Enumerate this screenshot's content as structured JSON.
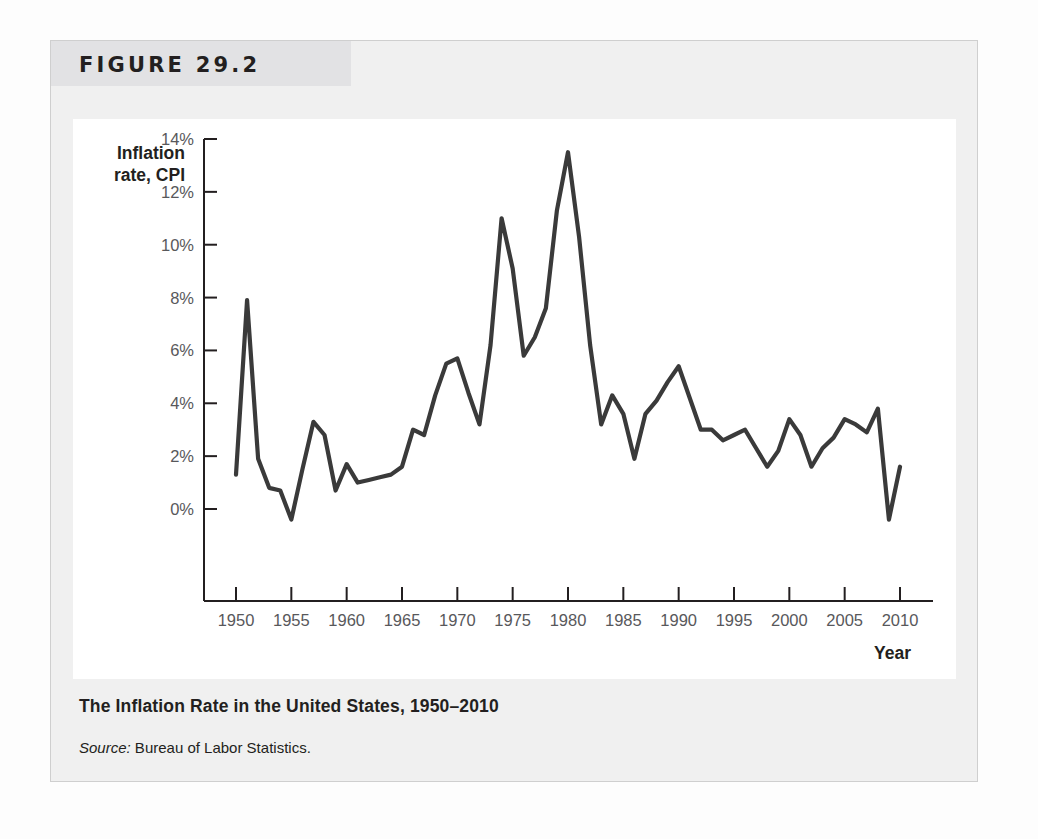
{
  "figure": {
    "number_label": "FIGURE 29.2",
    "caption_title": "The Inflation Rate in the United States, 1950–2010",
    "source_label": "Source:",
    "source_text": " Bureau of Labor Statistics."
  },
  "colors": {
    "line": "#3a3a3a",
    "axis": "#231f20",
    "banner": "#e2e2e4",
    "figure_bg": "#f0f0f0",
    "panel_bg": "#ffffff",
    "tick_label": "#58585b"
  },
  "chart_data": {
    "type": "line",
    "title": "The Inflation Rate in the United States, 1950–2010",
    "xlabel": "Year",
    "ylabel": "Inflation rate, CPI",
    "ylabel_lines": [
      "Inflation",
      "rate, CPI"
    ],
    "xlim": [
      1949,
      2011.5
    ],
    "ylim": [
      -1.2,
      14.6
    ],
    "grid": false,
    "legend": null,
    "ytick_values": [
      0,
      2,
      4,
      6,
      8,
      10,
      12,
      14
    ],
    "ytick_labels": [
      "0%",
      "2%",
      "4%",
      "6%",
      "8%",
      "10%",
      "12%",
      "14%"
    ],
    "xtick_values": [
      1950,
      1955,
      1960,
      1965,
      1970,
      1975,
      1980,
      1985,
      1990,
      1995,
      2000,
      2005,
      2010
    ],
    "xtick_labels": [
      "1950",
      "1955",
      "1960",
      "1965",
      "1970",
      "1975",
      "1980",
      "1985",
      "1990",
      "1995",
      "2000",
      "2005",
      "2010"
    ],
    "series": [
      {
        "name": "Inflation rate, CPI",
        "x": [
          1950,
          1951,
          1952,
          1953,
          1954,
          1955,
          1956,
          1957,
          1958,
          1959,
          1960,
          1961,
          1962,
          1963,
          1964,
          1965,
          1966,
          1967,
          1968,
          1969,
          1970,
          1971,
          1972,
          1973,
          1974,
          1975,
          1976,
          1977,
          1978,
          1979,
          1980,
          1981,
          1982,
          1983,
          1984,
          1985,
          1986,
          1987,
          1988,
          1989,
          1990,
          1991,
          1992,
          1993,
          1994,
          1995,
          1996,
          1997,
          1998,
          1999,
          2000,
          2001,
          2002,
          2003,
          2004,
          2005,
          2006,
          2007,
          2008,
          2009,
          2010
        ],
        "y": [
          1.3,
          7.9,
          1.9,
          0.8,
          0.7,
          -0.4,
          1.5,
          3.3,
          2.8,
          0.7,
          1.7,
          1.0,
          1.1,
          1.2,
          1.3,
          1.6,
          3.0,
          2.8,
          4.3,
          5.5,
          5.7,
          4.4,
          3.2,
          6.2,
          11.0,
          9.1,
          5.8,
          6.5,
          7.6,
          11.3,
          13.5,
          10.3,
          6.2,
          3.2,
          4.3,
          3.6,
          1.9,
          3.6,
          4.1,
          4.8,
          5.4,
          4.2,
          3.0,
          3.0,
          2.6,
          2.8,
          3.0,
          2.3,
          1.6,
          2.2,
          3.4,
          2.8,
          1.6,
          2.3,
          2.7,
          3.4,
          3.2,
          2.9,
          3.8,
          -0.4,
          1.6
        ]
      }
    ]
  }
}
